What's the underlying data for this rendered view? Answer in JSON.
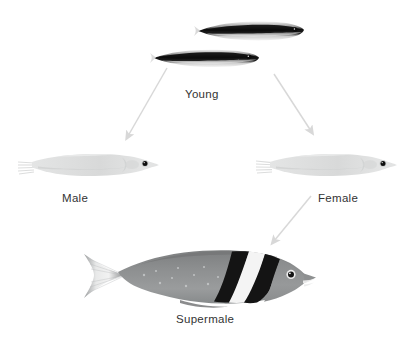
{
  "diagram": {
    "title_present": false,
    "background_color": "#ffffff",
    "label_color": "#333333",
    "arrow_color": "#d8d8d8",
    "type": "life-cycle-flow",
    "stages": [
      {
        "id": "young",
        "label": "Young",
        "label_x": 185,
        "label_y": 88,
        "count": 2,
        "appearance": "slender dark-striped juvenile fish"
      },
      {
        "id": "male",
        "label": "Male",
        "label_x": 62,
        "label_y": 192,
        "count": 1,
        "appearance": "pale grey initial-phase fish"
      },
      {
        "id": "female",
        "label": "Female",
        "label_x": 318,
        "label_y": 192,
        "count": 1,
        "appearance": "pale grey initial-phase fish"
      },
      {
        "id": "supermale",
        "label": "Supermale",
        "label_x": 176,
        "label_y": 313,
        "count": 1,
        "appearance": "large grey fish with two black bars and white bar"
      }
    ],
    "arrows": [
      {
        "id": "young-to-male",
        "from": "young",
        "to": "male",
        "x1": 167,
        "y1": 68,
        "x2": 126,
        "y2": 139
      },
      {
        "id": "young-to-female",
        "from": "young",
        "to": "female",
        "x1": 274,
        "y1": 74,
        "x2": 313,
        "y2": 134
      },
      {
        "id": "female-to-supermale",
        "from": "female",
        "to": "supermale",
        "x1": 311,
        "y1": 196,
        "x2": 272,
        "y2": 243
      }
    ],
    "colors": {
      "arrow": "#d8d8d8",
      "label_text": "#333333",
      "pale_fish_body": "#dfe0e0",
      "pale_fish_shade": "#cfd1d1",
      "supermale_body": "#8e9091",
      "supermale_dark": "#1c1c1c",
      "supermale_white": "#f5f5f5",
      "young_stripe": "#161616",
      "eye": "#101010"
    }
  }
}
